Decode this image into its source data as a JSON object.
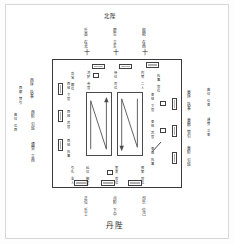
{
  "plate": {
    "title": "宫庭班位图",
    "caption": "丹陛"
  },
  "hall": {
    "name": "正殿",
    "courts": [
      {
        "id": "left",
        "path_label": "西班行列",
        "arrow": "up"
      },
      {
        "id": "right",
        "path_label": "東班行列",
        "arrow": "down"
      }
    ]
  },
  "top_outside": {
    "header": "北陛",
    "columns": [
      {
        "text": "乐县\n在北"
      },
      {
        "text": "麾生\n立东"
      },
      {
        "text": "鼓柷\n在西"
      }
    ],
    "marks": [
      "十",
      "十",
      "十"
    ]
  },
  "bottom_outside": {
    "columns": [
      {
        "text": "正位\n乐工"
      },
      {
        "text": "点阶\n下中"
      },
      {
        "text": "司乐\n位己"
      }
    ],
    "caption": "丹陛"
  },
  "left_outside": {
    "columns": [
      {
        "text": "西序\n执事"
      },
      {
        "text": "西廊\n赞引"
      },
      {
        "text": "西阶\n引班"
      },
      {
        "text": "典仪\n位西"
      },
      {
        "text": "通赞\n立西"
      }
    ]
  },
  "right_outside": {
    "columns": [
      {
        "text": "東序\n执事"
      },
      {
        "text": "東廊\n赞引"
      },
      {
        "text": "東阶\n引班"
      },
      {
        "text": "典仪\n位東"
      },
      {
        "text": "通赞\n立東"
      }
    ]
  },
  "hall_inside": {
    "north_row": [
      {
        "text": "尚宝\n卿位"
      },
      {
        "text": "鸿胪\n寺官"
      },
      {
        "text": "侍仪\n司位"
      },
      {
        "text": "内赞\n二人"
      },
      {
        "text": "执事\n官位"
      }
    ],
    "west_column": [
      {
        "text": "西班\n文官"
      },
      {
        "text": "西班\n武官"
      },
      {
        "text": "西班\n执事"
      }
    ],
    "east_column": [
      {
        "text": "東班\n文官"
      },
      {
        "text": "東班\n武官"
      },
      {
        "text": "東班\n执事"
      }
    ],
    "south_row": [
      {
        "text": "引礼\n舍人"
      },
      {
        "text": "纠仪\n御史"
      },
      {
        "text": "宣表\n官位"
      },
      {
        "text": "捧案\n官位"
      }
    ]
  },
  "tablets": {
    "north": [
      {
        "id": "n1",
        "label": "宝案"
      },
      {
        "id": "n2",
        "label": "表案"
      },
      {
        "id": "n3",
        "label": "御座"
      }
    ],
    "south": [
      {
        "id": "s1",
        "label": "香案"
      },
      {
        "id": "s2",
        "label": "拜位"
      },
      {
        "id": "s3",
        "label": "拜位"
      }
    ],
    "west": [
      {
        "id": "w1",
        "label": "位牌"
      },
      {
        "id": "w2",
        "label": "位牌"
      },
      {
        "id": "w3",
        "label": "位牌"
      }
    ],
    "east": [
      {
        "id": "e1",
        "label": "位牌"
      },
      {
        "id": "e2",
        "label": "位牌"
      },
      {
        "id": "e3",
        "label": "位牌"
      }
    ]
  },
  "colors": {
    "ink": "#1f1f1f",
    "rule": "#3a3a3a",
    "frame": "#d8d8d8",
    "paper": "#ffffff",
    "tablet_fill": "#6e6e6e"
  }
}
